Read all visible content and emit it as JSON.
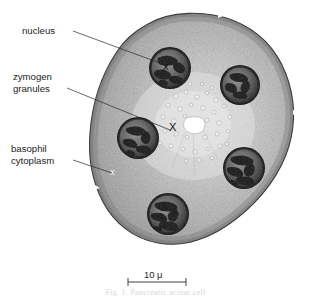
{
  "figure": {
    "labels": [
      {
        "id": "nucleus",
        "text": "nucleus",
        "text2": "",
        "x": 22,
        "y": 34
      },
      {
        "id": "zymogen-granules",
        "text": "zymogen",
        "text2": "granules",
        "x": 13,
        "y": 80
      },
      {
        "id": "basophil-cytoplasm",
        "text": "basophil",
        "text2": "cytoplasm",
        "x": 11,
        "y": 152
      }
    ],
    "markers": {
      "lumen_x": "X",
      "nucleus_x": "x",
      "cytoplasm_x": "x"
    },
    "scale_bar": {
      "value": "10",
      "unit": "μ",
      "label": "10 μ",
      "x_start": 128,
      "x_end": 186,
      "y": 282
    },
    "caption": "Fig. 1. Pancreatic acinar cell",
    "colors": {
      "cytoplasm_light": "#cfcfcf",
      "cytoplasm_mid": "#a9a9a9",
      "cytoplasm_dark": "#8a8a8a",
      "outline": "#3a3a3a",
      "nucleus_rim": "#121212",
      "chromatin": "#141414",
      "lumen": "#ffffff",
      "text": "#1d1d1d",
      "background": "#ffffff"
    },
    "nuclei": [
      {
        "id": "nucleus-1",
        "cx": 170,
        "cy": 68,
        "r": 21
      },
      {
        "id": "nucleus-2",
        "cx": 240,
        "cy": 85,
        "r": 20
      },
      {
        "id": "nucleus-3",
        "cx": 138,
        "cy": 138,
        "r": 21
      },
      {
        "id": "nucleus-4",
        "cx": 244,
        "cy": 168,
        "r": 21
      },
      {
        "id": "nucleus-5",
        "cx": 168,
        "cy": 214,
        "r": 21
      }
    ],
    "lumen": {
      "cx": 193,
      "cy": 126,
      "rx": 11,
      "ry": 7
    }
  }
}
